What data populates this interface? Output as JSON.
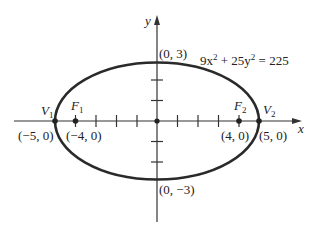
{
  "diagram": {
    "equation": {
      "pre": "9x",
      "sup1": "2",
      "mid": " + 25y",
      "sup2": "2",
      "post": " = 225"
    },
    "axes": {
      "x_label": "x",
      "y_label": "y"
    },
    "points": {
      "V1": {
        "name": "V",
        "sub": "1",
        "coord": "(−5, 0)"
      },
      "F1": {
        "name": "F",
        "sub": "1",
        "coord": "(−4, 0)"
      },
      "F2": {
        "name": "F",
        "sub": "2",
        "coord": "(4, 0)"
      },
      "V2": {
        "name": "V",
        "sub": "2",
        "coord": "(5, 0)"
      },
      "top": {
        "coord": "(0, 3)"
      },
      "bottom": {
        "coord": "(0, −3)"
      }
    },
    "colors": {
      "stroke": "#222222",
      "background": "#ffffff"
    }
  }
}
